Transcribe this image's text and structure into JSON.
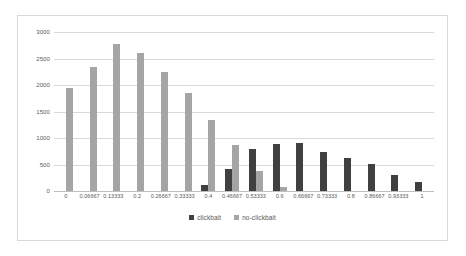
{
  "chart_data": {
    "type": "bar",
    "title": "",
    "xlabel": "",
    "ylabel": "",
    "ylim": [
      0,
      3000
    ],
    "yticks": [
      0,
      500,
      1000,
      1500,
      2000,
      2500,
      3000
    ],
    "ytick_labels": [
      "0",
      "500",
      "1000",
      "1500",
      "2000",
      "2500",
      "3000"
    ],
    "grid": true,
    "legend_position": "bottom",
    "categories": [
      "0",
      "0.06667",
      "0.13333",
      "0.2",
      "0.26667",
      "0.33333",
      "0.4",
      "0.46667",
      "0.53333",
      "0.6",
      "0.66667",
      "0.73333",
      "0.8",
      "0.86667",
      "0.93333",
      "1"
    ],
    "series": [
      {
        "name": "clickbait",
        "color": "#404040",
        "values": [
          0,
          0,
          0,
          0,
          0,
          0,
          110,
          420,
          790,
          880,
          900,
          740,
          630,
          510,
          300,
          170
        ]
      },
      {
        "name": "no-clickbait",
        "color": "#a5a5a5",
        "values": [
          1940,
          2340,
          2780,
          2600,
          2250,
          1840,
          1340,
          870,
          380,
          70,
          0,
          0,
          0,
          0,
          0,
          0
        ]
      }
    ]
  },
  "colors": {
    "clickbait": "#404040",
    "no_clickbait": "#a5a5a5",
    "gridline": "#d9d9d9",
    "axis_text": "#595959",
    "chart_border": "#d9d9d9",
    "background": "#ffffff"
  }
}
